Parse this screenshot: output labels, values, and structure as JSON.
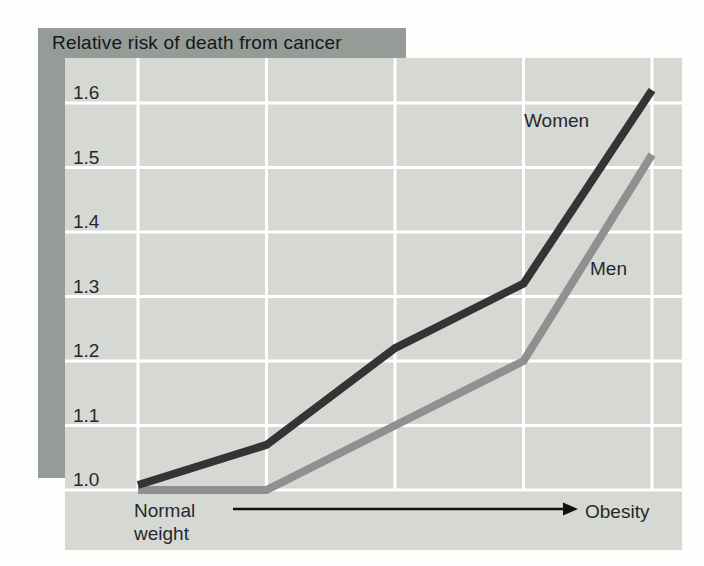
{
  "title": "Relative risk of death from cancer",
  "chart_data": {
    "type": "line",
    "title": "Relative risk of death from cancer",
    "categories": [
      "Normal weight",
      "",
      "",
      "",
      "Obesity"
    ],
    "series": [
      {
        "name": "Women",
        "values": [
          1.0,
          1.07,
          1.22,
          1.32,
          1.62
        ],
        "color": "#343434"
      },
      {
        "name": "Men",
        "values": [
          1.0,
          1.0,
          1.1,
          1.2,
          1.52
        ],
        "color": "#8e918f"
      }
    ],
    "yticks": [
      1.0,
      1.1,
      1.2,
      1.3,
      1.4,
      1.5,
      1.6
    ],
    "ytick_labels": [
      "1.0",
      "1.1",
      "1.2",
      "1.3",
      "1.4",
      "1.5",
      "1.6"
    ],
    "ylim": [
      1.0,
      1.67
    ],
    "xlabel_left": "Normal\nweight",
    "xlabel_right": "Obesity",
    "grid": true,
    "legend_position": "inline-labels"
  },
  "colors": {
    "banner": "#959b97",
    "panel": "#d6d8d4",
    "grid": "#ffffff",
    "arrow": "#121212",
    "text": "#26292b"
  }
}
